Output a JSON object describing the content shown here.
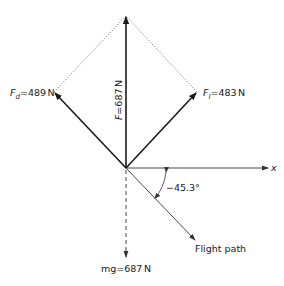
{
  "diagram": {
    "type": "free-body force diagram",
    "colors": {
      "ink": "#1a1a1a",
      "thin": "#333333",
      "dotted": "#666666",
      "background": "#ffffff"
    },
    "forces": {
      "resultant": {
        "symbol": "F",
        "equals": "=",
        "value": "687",
        "unit": "N",
        "direction_deg": 90
      },
      "drag": {
        "symbol": "F",
        "subscript": "d",
        "equals": "=",
        "value": "489",
        "unit": "N",
        "direction_deg": 134.7
      },
      "lift": {
        "symbol": "F",
        "subscript": "l",
        "equals": "=",
        "value": "483",
        "unit": "N",
        "direction_deg": 44.7
      },
      "weight": {
        "label": "mg",
        "equals": "=",
        "value": "687",
        "unit": "N",
        "direction_deg": -90,
        "style": "dashed"
      }
    },
    "axis": {
      "label": "x"
    },
    "flight_path": {
      "label": "Flight path",
      "angle_label": "−45.3°",
      "angle_deg": -45.3
    }
  }
}
